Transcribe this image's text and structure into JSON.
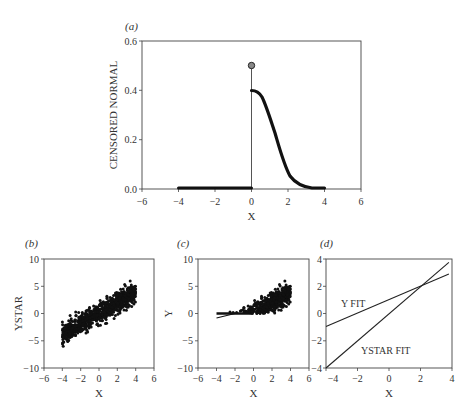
{
  "figure": {
    "panels": [
      "(a)",
      "(b)",
      "(c)",
      "(d)"
    ]
  },
  "chart_data": [
    {
      "panel": "(a)",
      "type": "line",
      "title": "",
      "xlabel": "X",
      "ylabel": "CENSORED NORMAL",
      "xlim": [
        -6,
        6
      ],
      "ylim": [
        0.0,
        0.6
      ],
      "xticks": [
        -6,
        -4,
        -2,
        0,
        2,
        4,
        6
      ],
      "yticks": [
        "0.0",
        "0.2",
        "0.4",
        "0.6"
      ],
      "series": [
        {
          "name": "density (x<0, censored)",
          "x": [
            -4,
            -3,
            -2,
            -1,
            0
          ],
          "y": [
            0,
            0,
            0,
            0,
            0
          ]
        },
        {
          "name": "density (x>=0)",
          "x": [
            0,
            0.5,
            1,
            1.5,
            2,
            2.5,
            3,
            3.5,
            4
          ],
          "y": [
            0.399,
            0.352,
            0.242,
            0.13,
            0.054,
            0.018,
            0.004,
            0.001,
            0.0
          ]
        },
        {
          "name": "point mass at 0",
          "x": [
            0
          ],
          "y": [
            0.5
          ],
          "marker": "circle",
          "spike": true
        }
      ],
      "grid": false
    },
    {
      "panel": "(b)",
      "type": "scatter",
      "xlabel": "X",
      "ylabel": "YSTAR",
      "xlim": [
        -6,
        6
      ],
      "ylim": [
        -10,
        10
      ],
      "xticks": [
        -6,
        -4,
        -2,
        0,
        2,
        4,
        6
      ],
      "yticks": [
        -10,
        -5,
        0,
        5,
        10
      ],
      "description": "Dense cloud of points along y = x, x from -4 to 4, y roughly from -6 to 6",
      "trend": {
        "slope": 1.0,
        "intercept": 0.0
      }
    },
    {
      "panel": "(c)",
      "type": "scatter",
      "xlabel": "X",
      "ylabel": "Y",
      "xlim": [
        -6,
        6
      ],
      "ylim": [
        -10,
        10
      ],
      "xticks": [
        -6,
        -4,
        -2,
        0,
        2,
        4,
        6
      ],
      "yticks": [
        -10,
        -5,
        0,
        5,
        10
      ],
      "description": "Censored version of (b): points with YSTAR<0 set to 0; cloud for x>0 rising to ~6 at x=4, plus short fit line from (-4,-0.9)"
    },
    {
      "panel": "(d)",
      "type": "line",
      "xlabel": "X",
      "ylabel": "",
      "xlim": [
        -4,
        4
      ],
      "ylim": [
        -4,
        4
      ],
      "xticks": [
        -4,
        -2,
        0,
        2,
        4
      ],
      "yticks": [
        -4,
        -2,
        0,
        2,
        4
      ],
      "series": [
        {
          "name": "Y FIT",
          "x": [
            -4,
            3.8
          ],
          "y": [
            -0.95,
            2.9
          ]
        },
        {
          "name": "YSTAR FIT",
          "x": [
            -4,
            3.8
          ],
          "y": [
            -4.0,
            3.75
          ]
        }
      ],
      "annotations": [
        "Y FIT",
        "YSTAR FIT"
      ]
    }
  ],
  "labels": {
    "a": {
      "tag": "(a)",
      "ylabel": "CENSORED NORMAL",
      "xlabel": "X",
      "yticks": [
        "0.0",
        "0.2",
        "0.4",
        "0.6"
      ],
      "xticks": [
        "−6",
        "−4",
        "−2",
        "0",
        "2",
        "4",
        "6"
      ]
    },
    "b": {
      "tag": "(b)",
      "ylabel": "YSTAR",
      "xlabel": "X",
      "yticks": [
        "−10",
        "−5",
        "0",
        "5",
        "10"
      ],
      "xticks": [
        "−6",
        "−4",
        "−2",
        "0",
        "2",
        "4",
        "6"
      ]
    },
    "c": {
      "tag": "(c)",
      "ylabel": "Y",
      "xlabel": "X",
      "yticks": [
        "−10",
        "−5",
        "0",
        "5",
        "10"
      ],
      "xticks": [
        "−6",
        "−4",
        "−2",
        "0",
        "2",
        "4",
        "6"
      ]
    },
    "d": {
      "tag": "(d)",
      "xlabel": "X",
      "yfit": "Y FIT",
      "ystarfit": "YSTAR FIT",
      "yticks": [
        "−4",
        "−2",
        "0",
        "2",
        "4"
      ],
      "xticks": [
        "−4",
        "−2",
        "0",
        "2",
        "4"
      ]
    }
  }
}
